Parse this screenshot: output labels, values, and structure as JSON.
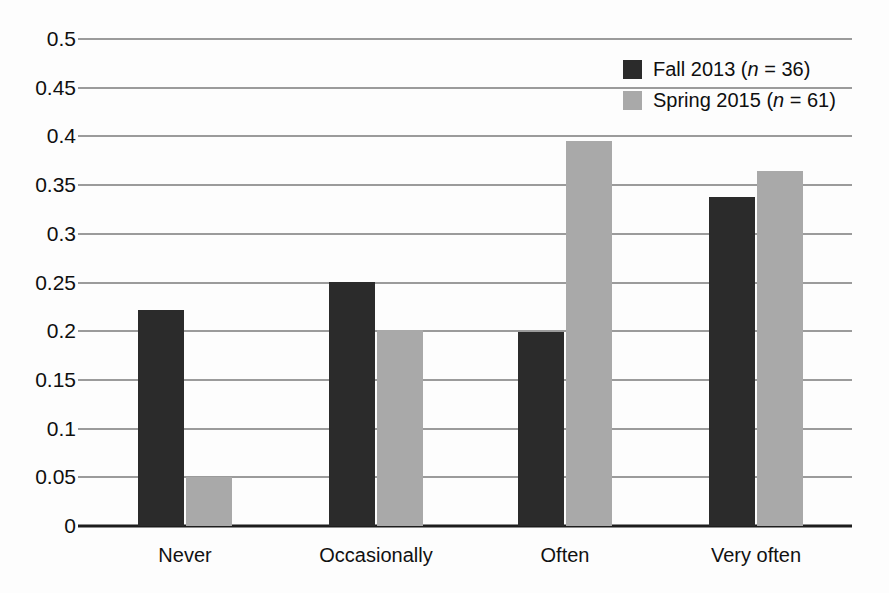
{
  "chart_data": {
    "type": "bar",
    "title": "",
    "subtitle": "",
    "xlabel": "",
    "ylabel": "",
    "ylim": [
      0,
      0.5
    ],
    "yticks": [
      "0",
      "0.05",
      "0.1",
      "0.15",
      "0.2",
      "0.25",
      "0.3",
      "0.35",
      "0.4",
      "0.45",
      "0.5"
    ],
    "ytick_values": [
      0,
      0.05,
      0.1,
      0.15,
      0.2,
      0.25,
      0.3,
      0.35,
      0.4,
      0.45,
      0.5
    ],
    "grid": true,
    "grid_axis": "y",
    "legend_position": "top-right",
    "categories": [
      "Never",
      "Occasionally",
      "Often",
      "Very often"
    ],
    "series": [
      {
        "name": "Fall 2013 (n = 36)",
        "color": "#2b2b2b",
        "values": [
          0.222,
          0.251,
          0.199,
          0.338
        ]
      },
      {
        "name": "Spring 2015 (n = 61)",
        "color": "#a9a9a9",
        "values": [
          0.05,
          0.201,
          0.395,
          0.365
        ]
      }
    ]
  },
  "legend": {
    "entries": [
      {
        "swatch": "dark",
        "prefix": "Fall 2013 (",
        "italic": "n",
        "suffix": " = 36)",
        "full": "Fall 2013 (n = 36)"
      },
      {
        "swatch": "light",
        "prefix": "Spring 2015 (",
        "italic": "n",
        "suffix": " = 61)",
        "full": "Spring 2015 (n = 61)"
      }
    ]
  },
  "axis": {
    "y_labels": [
      "0.5",
      "0.45",
      "0.4",
      "0.35",
      "0.3",
      "0.25",
      "0.2",
      "0.15",
      "0.1",
      "0.05",
      "0"
    ],
    "x_labels": [
      "Never",
      "Occasionally",
      "Often",
      "Very often"
    ]
  },
  "colors": {
    "series_dark": "#2b2b2b",
    "series_light": "#a9a9a9",
    "gridline": "#3a3a3a",
    "axis": "#1d1d1d",
    "text": "#0f0f0f",
    "background": "#fdfdfd"
  }
}
